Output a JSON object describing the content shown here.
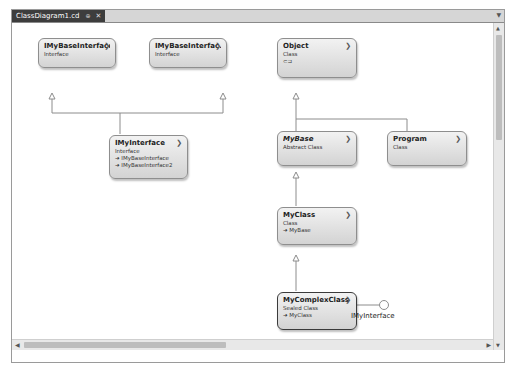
{
  "tab": {
    "title": "ClassDiagram1.cd",
    "pin_icon": "⊕",
    "close_icon": "✕"
  },
  "shapes": {
    "ibase1": {
      "name": "IMyBaseInterface",
      "kind": "Interface"
    },
    "ibase2": {
      "name": "IMyBaseInterfac...",
      "kind": "Interface"
    },
    "imyint": {
      "name": "IMyInterface",
      "kind": "Interface",
      "inherits": [
        "IMyBaseInterface",
        "IMyBaseInterface2"
      ]
    },
    "object": {
      "name": "Object",
      "kind": "Class",
      "extra": "⊂⊐"
    },
    "mybase": {
      "name": "MyBase",
      "kind": "Abstract Class"
    },
    "program": {
      "name": "Program",
      "kind": "Class"
    },
    "myclass": {
      "name": "MyClass",
      "kind": "Class",
      "inherits": [
        "MyBase"
      ]
    },
    "complex": {
      "name": "MyComplexClass",
      "kind": "Sealed Class",
      "inherits": [
        "MyClass"
      ]
    }
  },
  "lollipop_label": "IMyInterface",
  "icons": {
    "chevron": "❯",
    "inherit_arrow": "➜"
  }
}
